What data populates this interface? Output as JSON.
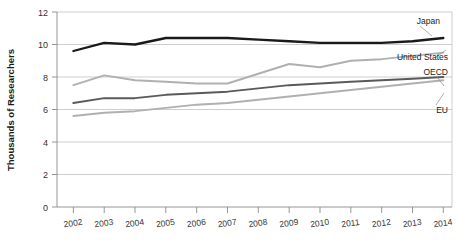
{
  "chart_data": {
    "type": "line",
    "title": "",
    "xlabel": "",
    "ylabel": "Thousands of Researchers",
    "categories": [
      "2002",
      "2003",
      "2004",
      "2005",
      "2006",
      "2007",
      "2008",
      "2009",
      "2010",
      "2011",
      "2012",
      "2013",
      "2014"
    ],
    "x": [
      2002,
      2003,
      2004,
      2005,
      2006,
      2007,
      2008,
      2009,
      2010,
      2011,
      2012,
      2013,
      2014
    ],
    "ylim": [
      0,
      12
    ],
    "yticks": [
      0,
      2,
      4,
      6,
      8,
      10,
      12
    ],
    "ytick_labels": [
      "0",
      "2",
      "4",
      "6",
      "8",
      "10",
      "12"
    ],
    "grid": true,
    "legend_position": "right-inline-labels",
    "series": [
      {
        "name": "Japan",
        "color": "#1a1a1a",
        "values": [
          9.6,
          10.1,
          10.0,
          10.4,
          10.4,
          10.4,
          10.3,
          10.2,
          10.1,
          10.1,
          10.1,
          10.2,
          10.4
        ]
      },
      {
        "name": "United States",
        "color": "#b0b0b0",
        "values": [
          7.5,
          8.1,
          7.8,
          7.7,
          7.6,
          7.6,
          8.2,
          8.8,
          8.6,
          9.0,
          9.1,
          9.3,
          9.5
        ]
      },
      {
        "name": "OECD",
        "color": "#5a5a5a",
        "values": [
          6.4,
          6.7,
          6.7,
          6.9,
          7.0,
          7.1,
          7.3,
          7.5,
          7.6,
          7.7,
          7.8,
          7.9,
          8.0
        ]
      },
      {
        "name": "EU",
        "color": "#b0b0b0",
        "values": [
          5.6,
          5.8,
          5.9,
          6.1,
          6.3,
          6.4,
          6.6,
          6.8,
          7.0,
          7.2,
          7.4,
          7.6,
          7.8
        ]
      }
    ]
  },
  "axis": {
    "y_title": "Thousands of Researchers"
  },
  "labels": {
    "japan": "Japan",
    "united_states": "United States",
    "oecd": "OECD",
    "eu": "EU"
  },
  "yticks": {
    "t0": "0",
    "t1": "2",
    "t2": "4",
    "t3": "6",
    "t4": "8",
    "t5": "10",
    "t6": "12"
  },
  "xticks": {
    "x0": "2002",
    "x1": "2003",
    "x2": "2004",
    "x3": "2005",
    "x4": "2006",
    "x5": "2007",
    "x6": "2008",
    "x7": "2009",
    "x8": "2010",
    "x9": "2011",
    "x10": "2012",
    "x11": "2013",
    "x12": "2014"
  }
}
